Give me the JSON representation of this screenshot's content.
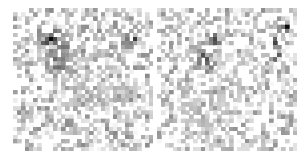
{
  "figure": {
    "name": "two-panel-grayscale-heatmap-figure",
    "width": 307,
    "height": 154,
    "background_color": "#ffffff",
    "panel_count": 2,
    "layout": "side-by-side"
  },
  "chart_data": [
    {
      "type": "heatmap",
      "name": "left-heatmap",
      "title": "",
      "subtitle": "",
      "xlabel": "",
      "ylabel": "",
      "xticklabels": [],
      "yticklabels": [],
      "grid": false,
      "legend": false,
      "colormap": "gray_r",
      "colormap_stops": [
        "#ffffff",
        "#d9d9d9",
        "#b3b3b3",
        "#8c8c8c",
        "#666666",
        "#404040",
        "#1a1a1a"
      ],
      "vmin": 0,
      "vmax": 1,
      "rows": 35,
      "cols": 35,
      "cell_px": 4,
      "origin_px": [
        13,
        8
      ],
      "panel_px": [
        140,
        143
      ],
      "seed": 20431,
      "noise": {
        "base_low": 0.0,
        "base_high": 0.3,
        "sparsity": 0.46,
        "mid_low": 0.22,
        "mid_high": 0.48
      },
      "clusters": [
        {
          "name": "upper-left-dark-core",
          "center_col": 9,
          "center_row": 7,
          "radius": 3.2,
          "peak": 0.97,
          "density": 0.72
        },
        {
          "name": "upper-left-halo",
          "center_col": 11,
          "center_row": 9,
          "radius": 5.4,
          "peak": 0.62,
          "density": 0.6
        },
        {
          "name": "mid-left-dark-core",
          "center_col": 10,
          "center_row": 13,
          "radius": 2.6,
          "peak": 0.95,
          "density": 0.66
        },
        {
          "name": "mid-left-halo",
          "center_col": 12,
          "center_row": 13,
          "radius": 4.6,
          "peak": 0.55,
          "density": 0.55
        },
        {
          "name": "upper-right-dark-block",
          "center_col": 30,
          "center_row": 7,
          "radius": 2.4,
          "peak": 0.99,
          "density": 0.7
        },
        {
          "name": "center-gray-band",
          "center_col": 17,
          "center_row": 17,
          "radius": 8.0,
          "peak": 0.36,
          "density": 0.42
        },
        {
          "name": "lower-right-gray",
          "center_col": 26,
          "center_row": 22,
          "radius": 6.0,
          "peak": 0.34,
          "density": 0.4
        },
        {
          "name": "bottom-sparse",
          "center_col": 17,
          "center_row": 31,
          "radius": 7.0,
          "peak": 0.22,
          "density": 0.26
        }
      ]
    },
    {
      "type": "heatmap",
      "name": "right-heatmap",
      "title": "",
      "subtitle": "",
      "xlabel": "",
      "ylabel": "",
      "xticklabels": [],
      "yticklabels": [],
      "grid": false,
      "legend": false,
      "colormap": "gray_r",
      "colormap_stops": [
        "#ffffff",
        "#d9d9d9",
        "#b3b3b3",
        "#8c8c8c",
        "#666666",
        "#404040",
        "#1a1a1a"
      ],
      "vmin": 0,
      "vmax": 1,
      "rows": 35,
      "cols": 35,
      "cell_px": 4,
      "origin_px": [
        157,
        8
      ],
      "panel_px": [
        140,
        143
      ],
      "seed": 77185,
      "noise": {
        "base_low": 0.0,
        "base_high": 0.28,
        "sparsity": 0.48,
        "mid_low": 0.2,
        "mid_high": 0.46
      },
      "clusters": [
        {
          "name": "center-dark-spot-a",
          "center_col": 14,
          "center_row": 7,
          "radius": 1.9,
          "peak": 0.97,
          "density": 0.74
        },
        {
          "name": "center-dark-spot-b",
          "center_col": 11,
          "center_row": 12,
          "radius": 1.8,
          "peak": 0.96,
          "density": 0.72
        },
        {
          "name": "center-dark-spot-c",
          "center_col": 12,
          "center_row": 14,
          "radius": 1.6,
          "peak": 0.98,
          "density": 0.76
        },
        {
          "name": "left-mid-halo",
          "center_col": 11,
          "center_row": 10,
          "radius": 5.2,
          "peak": 0.5,
          "density": 0.52
        },
        {
          "name": "right-dark-spot-top",
          "center_col": 32,
          "center_row": 4,
          "radius": 1.3,
          "peak": 0.99,
          "density": 0.8
        },
        {
          "name": "right-dark-spot-mid",
          "center_col": 29,
          "center_row": 8,
          "radius": 1.4,
          "peak": 0.95,
          "density": 0.74
        },
        {
          "name": "right-dark-spot-low",
          "center_col": 29,
          "center_row": 11,
          "radius": 1.5,
          "peak": 0.93,
          "density": 0.7
        },
        {
          "name": "center-gray-band",
          "center_col": 18,
          "center_row": 18,
          "radius": 7.5,
          "peak": 0.34,
          "density": 0.42
        },
        {
          "name": "lower-left-gray",
          "center_col": 9,
          "center_row": 26,
          "radius": 6.5,
          "peak": 0.32,
          "density": 0.4
        },
        {
          "name": "bottom-band",
          "center_col": 16,
          "center_row": 31,
          "radius": 8.0,
          "peak": 0.28,
          "density": 0.34
        }
      ]
    }
  ]
}
